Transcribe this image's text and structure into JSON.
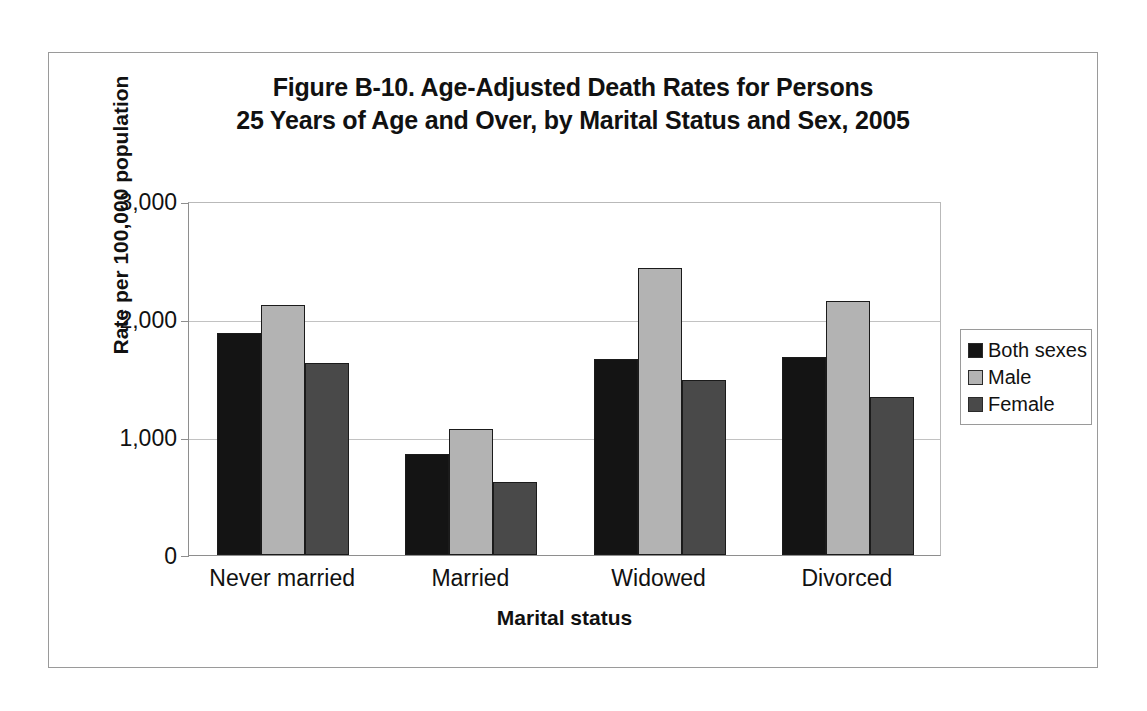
{
  "figure": {
    "title_line_1": "Figure B-10. Age-Adjusted Death Rates for Persons",
    "title_line_2": "25 Years of Age and Over, by Marital Status and Sex, 2005"
  },
  "axes": {
    "y_title": "Rate per 100,000 population",
    "x_title": "Marital status",
    "y_ticks": [
      "0",
      "1,000",
      "2,000",
      "3,000"
    ]
  },
  "legend": {
    "items": [
      {
        "label": "Both sexes",
        "color": "#141414"
      },
      {
        "label": "Male",
        "color": "#b3b3b3"
      },
      {
        "label": "Female",
        "color": "#494949"
      }
    ]
  },
  "chart_data": {
    "type": "bar",
    "title": "Figure B-10. Age-Adjusted Death Rates for Persons 25 Years of Age and Over, by Marital Status and Sex, 2005",
    "xlabel": "Marital status",
    "ylabel": "Rate per 100,000 population",
    "ylim": [
      0,
      3000
    ],
    "ytick_values": [
      0,
      1000,
      2000,
      3000
    ],
    "grid": true,
    "legend_position": "right",
    "categories": [
      "Never married",
      "Married",
      "Widowed",
      "Divorced"
    ],
    "series": [
      {
        "name": "Both sexes",
        "color": "#141414",
        "values": [
          1885,
          855,
          1665,
          1675
        ]
      },
      {
        "name": "Male",
        "color": "#b3b3b3",
        "values": [
          2120,
          1070,
          2430,
          2150
        ]
      },
      {
        "name": "Female",
        "color": "#494949",
        "values": [
          1625,
          615,
          1485,
          1340
        ]
      }
    ]
  }
}
